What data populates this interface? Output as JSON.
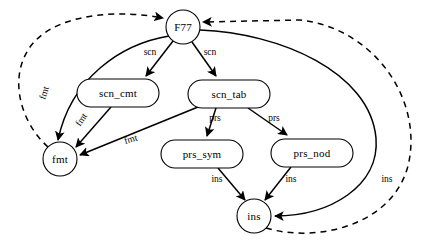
{
  "diagram": {
    "background_color": "#ffffff",
    "stroke_color": "#000000",
    "nodes": [
      {
        "id": "f77",
        "label": "F77",
        "shape": "circle",
        "cx": 183,
        "cy": 27,
        "rx": 17,
        "ry": 17
      },
      {
        "id": "scn_cmt",
        "label": "scn_cmt",
        "shape": "rounded",
        "cx": 118,
        "cy": 93,
        "rx": 41,
        "ry": 14
      },
      {
        "id": "scn_tab",
        "label": "scn_tab",
        "shape": "rounded",
        "cx": 229,
        "cy": 94,
        "rx": 41,
        "ry": 14
      },
      {
        "id": "fmt",
        "label": "fmt",
        "shape": "circle",
        "cx": 60,
        "cy": 159,
        "rx": 17,
        "ry": 17
      },
      {
        "id": "prs_sym",
        "label": "prs_sym",
        "shape": "rounded",
        "cx": 202,
        "cy": 154,
        "rx": 41,
        "ry": 14
      },
      {
        "id": "prs_nod",
        "label": "prs_nod",
        "shape": "rounded",
        "cx": 312,
        "cy": 153,
        "rx": 41,
        "ry": 14
      },
      {
        "id": "ins",
        "label": "ins",
        "shape": "circle",
        "cx": 254,
        "cy": 216,
        "rx": 17,
        "ry": 17
      }
    ],
    "edges": [
      {
        "id": "e-f77-scn_cmt",
        "from": "f77",
        "to": "scn_cmt",
        "label": "scn",
        "style": "solid",
        "label_x": 150,
        "label_y": 53,
        "label_rotate": 0
      },
      {
        "id": "e-f77-scn_tab",
        "from": "f77",
        "to": "scn_tab",
        "label": "scn",
        "style": "solid",
        "label_x": 210,
        "label_y": 53,
        "label_rotate": 0
      },
      {
        "id": "e-f77-fmt",
        "from": "f77",
        "to": "fmt",
        "label": "fmt",
        "style": "solid",
        "label_x": 45,
        "label_y": 93,
        "label_rotate": -72
      },
      {
        "id": "e-scn_cmt-fmt",
        "from": "scn_cmt",
        "to": "fmt",
        "label": "fmt",
        "style": "solid",
        "label_x": 82,
        "label_y": 120,
        "label_rotate": -56
      },
      {
        "id": "e-scn_tab-fmt",
        "from": "scn_tab",
        "to": "fmt",
        "label": "fmt",
        "style": "solid",
        "label_x": 131,
        "label_y": 140,
        "label_rotate": -17
      },
      {
        "id": "e-scn_tab-prs_sym",
        "from": "scn_tab",
        "to": "prs_sym",
        "label": "prs",
        "style": "solid",
        "label_x": 215,
        "label_y": 119,
        "label_rotate": 0
      },
      {
        "id": "e-scn_tab-prs_nod",
        "from": "scn_tab",
        "to": "prs_nod",
        "label": "prs",
        "style": "solid",
        "label_x": 274,
        "label_y": 119,
        "label_rotate": 0
      },
      {
        "id": "e-prs_sym-ins",
        "from": "prs_sym",
        "to": "ins",
        "label": "ins",
        "style": "solid",
        "label_x": 217,
        "label_y": 180,
        "label_rotate": 0
      },
      {
        "id": "e-prs_nod-ins",
        "from": "prs_nod",
        "to": "ins",
        "label": "ins",
        "style": "solid",
        "label_x": 291,
        "label_y": 180,
        "label_rotate": 0
      },
      {
        "id": "e-f77-ins",
        "from": "f77",
        "to": "ins",
        "label": "ins",
        "style": "solid",
        "label_x": 387,
        "label_y": 180,
        "label_rotate": 0
      },
      {
        "id": "e-fmt-f77",
        "from": "fmt",
        "to": "f77",
        "label": "",
        "style": "dashed",
        "label_x": 0,
        "label_y": 0,
        "label_rotate": 0
      },
      {
        "id": "e-ins-f77",
        "from": "ins",
        "to": "f77",
        "label": "",
        "style": "dashed",
        "label_x": 0,
        "label_y": 0,
        "label_rotate": 0
      }
    ]
  }
}
